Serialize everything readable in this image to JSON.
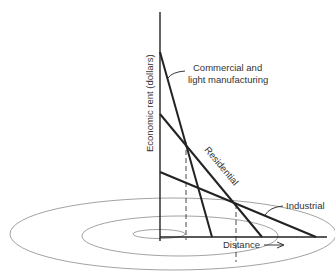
{
  "diagram": {
    "type": "bid-rent curve",
    "y_axis_label": "Economic rent (dollars)",
    "x_axis_label": "Distance",
    "lines": [
      {
        "name": "commercial",
        "label_line1": "Commercial and",
        "label_line2": "light manufacturing"
      },
      {
        "name": "residential",
        "label": "Residential"
      },
      {
        "name": "industrial",
        "label": "Industrial"
      }
    ],
    "rings": 3,
    "colors": {
      "line": "#222222",
      "ring": "#888888",
      "text": "#333333"
    }
  }
}
